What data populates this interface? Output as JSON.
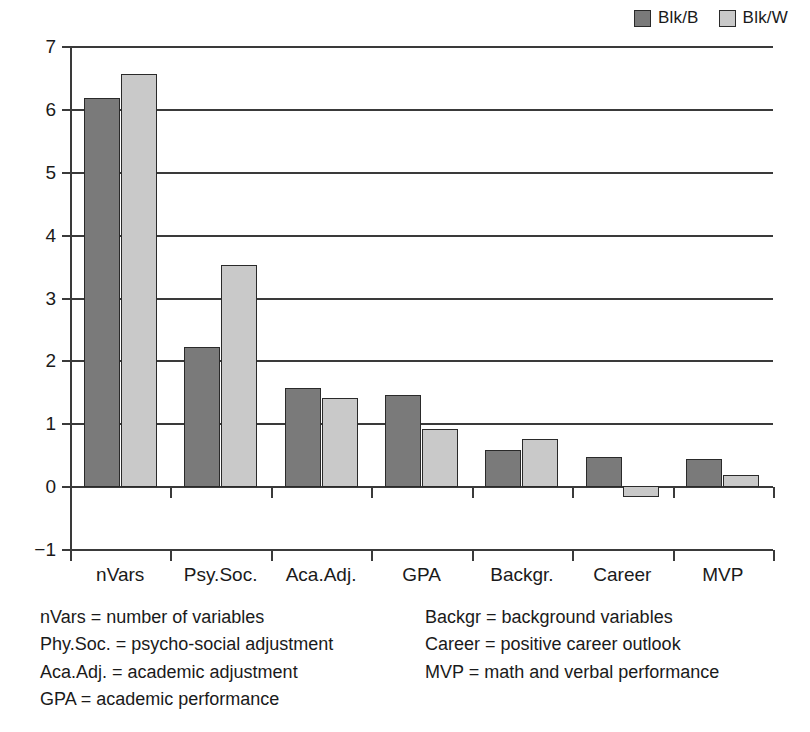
{
  "chart_data": {
    "type": "bar",
    "title": "",
    "subtitle": "",
    "xlabel": "",
    "ylabel": "",
    "categories": [
      "nVars",
      "Psy.Soc.",
      "Aca.Adj.",
      "GPA",
      "Backgr.",
      "Career",
      "MVP"
    ],
    "series": [
      {
        "name": "Blk/B",
        "color": "#7a7a7a",
        "values": [
          6.17,
          2.22,
          1.56,
          1.45,
          0.57,
          0.46,
          0.43
        ]
      },
      {
        "name": "Blk/W",
        "color": "#c9c9c9",
        "values": [
          6.56,
          3.51,
          1.4,
          0.91,
          0.75,
          -0.16,
          0.17
        ]
      }
    ],
    "ylim": [
      -1,
      7
    ],
    "yticks": [
      -1,
      0,
      1,
      2,
      3,
      4,
      5,
      6,
      7
    ],
    "ytick_labels": [
      "−1",
      "0",
      "1",
      "2",
      "3",
      "4",
      "5",
      "6",
      "7"
    ],
    "grid": "horizontal",
    "legend_position": "top-right"
  },
  "legend": {
    "entries": [
      {
        "label": "Blk/B",
        "color": "#7a7a7a"
      },
      {
        "label": "Blk/W",
        "color": "#c9c9c9"
      }
    ]
  },
  "axis": {
    "y_tick_labels": [
      "7",
      "6",
      "5",
      "4",
      "3",
      "2",
      "1",
      "0",
      "−1"
    ],
    "x_tick_labels": [
      "nVars",
      "Psy.Soc.",
      "Aca.Adj.",
      "GPA",
      "Backgr.",
      "Career",
      "MVP"
    ]
  },
  "notes": {
    "left": [
      "nVars = number of variables",
      "Phy.Soc. = psycho-social adjustment",
      "Aca.Adj. = academic adjustment",
      "GPA = academic performance"
    ],
    "right": [
      "Backgr = background variables",
      "Career = positive career outlook",
      "MVP = math and verbal performance"
    ]
  }
}
